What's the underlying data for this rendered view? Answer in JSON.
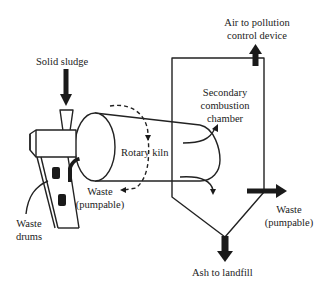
{
  "diagram": {
    "colors": {
      "line": "#222222",
      "arrow": "#1a1a1a",
      "background": "#ffffff"
    },
    "labels": {
      "solid_sludge": "Solid sludge",
      "air_line1": "Air to pollution",
      "air_line2": "control device",
      "secondary_line1": "Secondary",
      "secondary_line2": "combustion",
      "secondary_line3": "chamber",
      "rotary_kiln": "Rotary kiln",
      "waste_left_line1": "Waste",
      "waste_left_line2": "(pumpable)",
      "waste_drums_line1": "Waste",
      "waste_drums_line2": "drums",
      "waste_right_line1": "Waste",
      "waste_right_line2": "(pumpable)",
      "ash": "Ash to landfill"
    },
    "components": [
      "solid-sludge-feed-arrow",
      "feed-hopper",
      "rotary-kiln",
      "secondary-combustion-chamber",
      "air-outlet-arrow",
      "waste-pumpable-inlet-arrow",
      "ash-outlet-arrow",
      "waste-drum-conveyor",
      "waste-drum-icon"
    ]
  }
}
